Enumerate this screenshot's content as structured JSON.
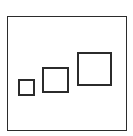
{
  "diagram": {
    "stroke_color": "#2b2b2b",
    "background": "#ffffff",
    "frame": {
      "x": 7,
      "y": 16,
      "w": 120,
      "h": 115,
      "stroke": 1
    },
    "squares": [
      {
        "label": "small",
        "x": 18,
        "y": 79,
        "w": 17,
        "h": 17,
        "stroke": 2
      },
      {
        "label": "medium",
        "x": 42,
        "y": 67,
        "w": 27,
        "h": 26,
        "stroke": 2
      },
      {
        "label": "large",
        "x": 77,
        "y": 52,
        "w": 35,
        "h": 34,
        "stroke": 2
      }
    ]
  }
}
